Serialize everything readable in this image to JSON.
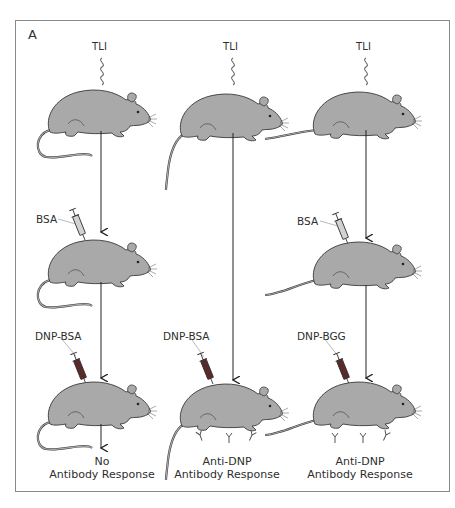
{
  "figure": {
    "panel_label": "A",
    "colors": {
      "rat_fill": "#a9a9a9",
      "rat_outline": "#3a3a3a",
      "syringe_bsa": "#cfcfcf",
      "syringe_dnp": "#5a2a2a",
      "frame": "#8a8a8a",
      "text": "#2e2e2e"
    },
    "columns": [
      {
        "id": "col1",
        "irradiation_label": "TLI",
        "first_injection": "BSA",
        "second_injection": "DNP-BSA",
        "outcome_line1": "No",
        "outcome_line2": "Antibody Response",
        "antibodies_shown": false
      },
      {
        "id": "col2",
        "irradiation_label": "TLI",
        "first_injection": null,
        "second_injection": "DNP-BSA",
        "outcome_line1": "Anti-DNP",
        "outcome_line2": "Antibody Response",
        "antibodies_shown": true
      },
      {
        "id": "col3",
        "irradiation_label": "TLI",
        "first_injection": "BSA",
        "second_injection": "DNP-BGG",
        "outcome_line1": "Anti-DNP",
        "outcome_line2": "Antibody Response",
        "antibodies_shown": true
      }
    ]
  }
}
